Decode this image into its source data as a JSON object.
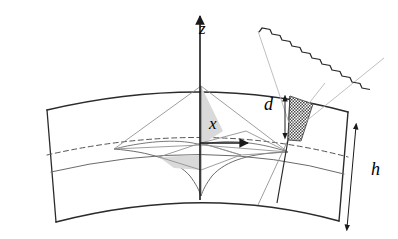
{
  "figure": {
    "background": "#ffffff",
    "stroke_color": "#3a3a3a",
    "stroke_color_dark": "#2b2b2b",
    "stroke_color_light": "#9a9a9a",
    "shade_fill": "#d9d9d9",
    "hatch_fill": "#555555",
    "width": 398,
    "height": 239
  },
  "labels": {
    "z_axis": "z",
    "x_axis": "x",
    "gap_thickness": "d",
    "band_height": "h"
  },
  "axes": {
    "z": {
      "name": "z-axis",
      "label": "z",
      "direction": "up",
      "arrow": true,
      "x": 200,
      "y_top": 14,
      "y_bottom": 200
    },
    "x": {
      "name": "x-axis",
      "label": "x",
      "direction": "right",
      "arrow": true,
      "y": 143,
      "x_start": 200,
      "x_end": 249
    }
  },
  "band": {
    "name": "curved-band",
    "outer_arc": {
      "left": [
        47,
        110
      ],
      "apex": [
        205,
        86
      ],
      "right": [
        348,
        112
      ]
    },
    "inner_arc": {
      "left": [
        56,
        222
      ],
      "apex": [
        205,
        196
      ],
      "right": [
        339,
        221
      ]
    },
    "equator_dashed": {
      "left": [
        47,
        155
      ],
      "apex": [
        205,
        131
      ],
      "right": [
        348,
        157
      ]
    },
    "mid_solid": {
      "left": [
        51,
        172
      ],
      "apex": [
        205,
        149
      ],
      "right": [
        344,
        174
      ]
    }
  },
  "measures": {
    "d": {
      "name": "gap-dimension",
      "label": "d",
      "arrow": "double-headed",
      "x": 285,
      "y_top": 97,
      "y_bottom": 137
    },
    "h": {
      "name": "height-dimension",
      "label": "h",
      "arrow": "double-headed",
      "top": [
        355,
        124
      ],
      "bottom": [
        347,
        228
      ]
    }
  },
  "wedge": {
    "name": "hatched-wedge",
    "pattern": "checkerboard",
    "apex": [
      288,
      140
    ],
    "top_left": [
      290,
      97
    ],
    "top_right": [
      312,
      104
    ]
  },
  "inset": {
    "name": "magnified-edge-inset",
    "pattern": "square-wave-crenellation",
    "teeth_count": 11,
    "apex_left": [
      258,
      45
    ],
    "apex_right": [
      327,
      83
    ],
    "edge_left": [
      260,
      30
    ],
    "edge_right": [
      384,
      57
    ]
  },
  "cusp": {
    "name": "pseudosphere-cusp",
    "description": "tractricoid horn with cusp at origin",
    "cusp_point": [
      201,
      196
    ],
    "flare_left": [
      114,
      148
    ],
    "flare_right": [
      288,
      152
    ]
  },
  "shaded_regions": [
    {
      "name": "shaded-triangle-upper",
      "fill": "#d9d9d9",
      "points": [
        [
          201,
          86
        ],
        [
          201,
          145
        ],
        [
          222,
          132
        ]
      ]
    },
    {
      "name": "shaded-region-lower",
      "fill": "#d9d9d9",
      "points": [
        [
          160,
          158
        ],
        [
          201,
          156
        ],
        [
          201,
          170
        ],
        [
          176,
          168
        ]
      ]
    }
  ]
}
